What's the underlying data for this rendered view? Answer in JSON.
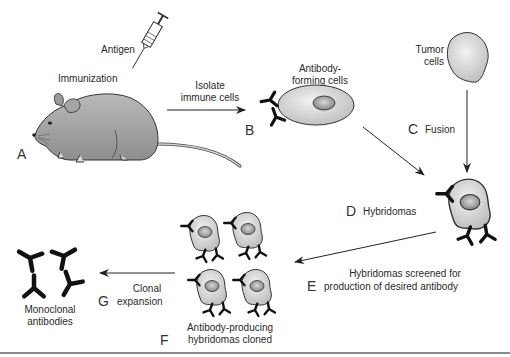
{
  "diagram": {
    "labels": {
      "antigen": "Antigen",
      "immunization": "Immunization",
      "isolate_line1": "Isolate",
      "isolate_line2": "immune cells",
      "antibody_forming_line1": "Antibody-",
      "antibody_forming_line2": "forming cells",
      "tumor_line1": "Tumor",
      "tumor_line2": "cells",
      "fusion": "Fusion",
      "hybridomas": "Hybridomas",
      "screened_line1": "Hybridomas screened for",
      "screened_line2": "production of desired antibody",
      "cloned_line1": "Antibody-producing",
      "cloned_line2": "hybridomas cloned",
      "clonal_line1": "Clonal",
      "clonal_line2": "expansion",
      "monoclonal_line1": "Monoclonal",
      "monoclonal_line2": "antibodies"
    },
    "steps": {
      "a": "A",
      "b": "B",
      "c": "C",
      "d": "D",
      "e": "E",
      "f": "F",
      "g": "G"
    },
    "colors": {
      "cell_fill": "#cfcfcf",
      "nucleus_fill": "#9a9a9a",
      "mouse_fill": "#a9a9a9",
      "antibody": "#111111",
      "arrow": "#222222",
      "rule": "#8a8a8a"
    }
  }
}
